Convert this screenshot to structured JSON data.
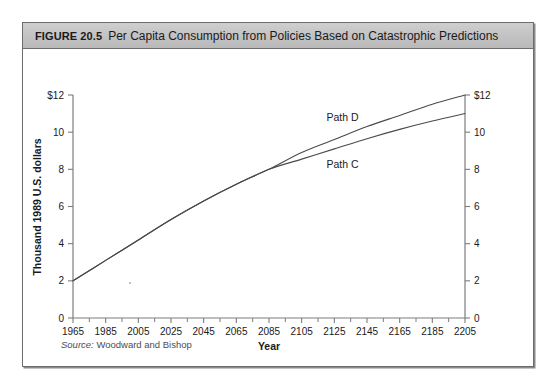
{
  "figure": {
    "number": "FIGURE 20.5",
    "title": "Per Capita Consumption from Policies Based on Catastrophic Predictions",
    "source_label": "Source:",
    "source_text": "Woodward and Bishop"
  },
  "chart_data": {
    "type": "line",
    "title": "Per Capita Consumption from Policies Based on Catastrophic Predictions",
    "xlabel": "Year",
    "ylabel": "Thousand 1989 U.S. dollars",
    "xlim": [
      1965,
      2205
    ],
    "ylim": [
      0,
      12
    ],
    "grid": false,
    "legend_position": "inline-labels",
    "x_ticks": [
      1965,
      1985,
      2005,
      2025,
      2045,
      2065,
      2085,
      2105,
      2125,
      2145,
      2165,
      2185,
      2205
    ],
    "x_minor_tick_step": 10,
    "y_ticks": [
      0,
      2,
      4,
      6,
      8,
      10,
      12
    ],
    "y_tick_labels": [
      "0",
      "2",
      "4",
      "6",
      "8",
      "10",
      "$12"
    ],
    "y_tick_labels_right": [
      "0",
      "2",
      "4",
      "6",
      "8",
      "10",
      "$12"
    ],
    "divergence_point": {
      "x": 2085,
      "y": 8.0
    },
    "series": [
      {
        "name": "Path D",
        "label_x": 2130,
        "label_y": 10.6,
        "x": [
          1965,
          1985,
          2005,
          2025,
          2045,
          2065,
          2085,
          2105,
          2125,
          2145,
          2165,
          2185,
          2205
        ],
        "values": [
          2.0,
          3.1,
          4.2,
          5.3,
          6.3,
          7.2,
          8.0,
          8.9,
          9.6,
          10.3,
          10.9,
          11.5,
          12.0
        ]
      },
      {
        "name": "Path C",
        "label_x": 2130,
        "label_y": 8.05,
        "x": [
          1965,
          1985,
          2005,
          2025,
          2045,
          2065,
          2085,
          2105,
          2125,
          2145,
          2165,
          2185,
          2205
        ],
        "values": [
          2.0,
          3.1,
          4.2,
          5.3,
          6.3,
          7.2,
          8.0,
          8.55,
          9.1,
          9.65,
          10.15,
          10.6,
          11.0
        ]
      }
    ]
  }
}
